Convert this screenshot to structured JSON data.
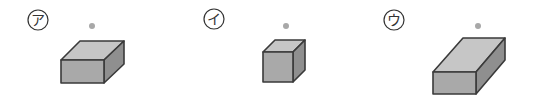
{
  "figures": [
    {
      "label": "ア",
      "label_pos": [
        38,
        20
      ],
      "dot": [
        92,
        26
      ],
      "front": [
        [
          61,
          60
        ],
        [
          104,
          60
        ],
        [
          104,
          83
        ],
        [
          61,
          83
        ]
      ],
      "top": [
        [
          61,
          60
        ],
        [
          80,
          41
        ],
        [
          124,
          41
        ],
        [
          104,
          60
        ]
      ],
      "side": [
        [
          104,
          60
        ],
        [
          124,
          41
        ],
        [
          124,
          64
        ],
        [
          104,
          83
        ]
      ]
    },
    {
      "label": "イ",
      "label_pos": [
        214,
        19
      ],
      "dot": [
        286,
        26
      ],
      "front": [
        [
          263,
          52
        ],
        [
          293,
          52
        ],
        [
          293,
          82
        ],
        [
          263,
          82
        ]
      ],
      "top": [
        [
          263,
          52
        ],
        [
          275,
          40
        ],
        [
          305,
          40
        ],
        [
          293,
          52
        ]
      ],
      "side": [
        [
          293,
          52
        ],
        [
          305,
          40
        ],
        [
          305,
          70
        ],
        [
          293,
          82
        ]
      ]
    },
    {
      "label": "ウ",
      "label_pos": [
        394,
        20
      ],
      "dot": [
        478,
        26
      ],
      "front": [
        [
          433,
          72
        ],
        [
          476,
          72
        ],
        [
          476,
          94
        ],
        [
          433,
          94
        ]
      ],
      "top": [
        [
          433,
          72
        ],
        [
          463,
          38
        ],
        [
          505,
          38
        ],
        [
          476,
          72
        ]
      ],
      "side": [
        [
          476,
          72
        ],
        [
          505,
          38
        ],
        [
          505,
          60
        ],
        [
          476,
          94
        ]
      ]
    }
  ],
  "colors": {
    "front": "#a9a9a9",
    "top": "#c6c6c6",
    "side": "#8f8f8f",
    "stroke": "#3a3a3a",
    "dot": "#a8a8a8",
    "label_circle": "#333333"
  }
}
